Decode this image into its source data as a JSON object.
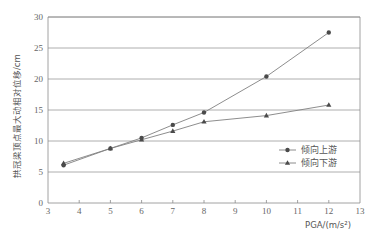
{
  "chart_data": {
    "type": "line",
    "title": "",
    "xlabel": "PGA/(m/s²)",
    "ylabel": "拱冠梁顶点最大动相对位移/cm",
    "xlim": [
      3,
      13
    ],
    "ylim": [
      0,
      30
    ],
    "xticks": [
      3,
      4,
      5,
      6,
      7,
      8,
      9,
      10,
      11,
      12,
      13
    ],
    "yticks": [
      0,
      5,
      10,
      15,
      20,
      25,
      30
    ],
    "grid": "horizontal",
    "legend_position": "lower right inside",
    "x": [
      3.5,
      5,
      6,
      7,
      8,
      10,
      12
    ],
    "series": [
      {
        "name": "倾向上游",
        "marker": "circle",
        "values": [
          6.1,
          8.8,
          10.5,
          12.6,
          14.6,
          20.4,
          27.5
        ]
      },
      {
        "name": "倾向下游",
        "marker": "triangle",
        "values": [
          6.4,
          8.8,
          10.2,
          11.6,
          13.1,
          14.1,
          15.8
        ]
      }
    ]
  },
  "colors": {
    "line": "#808080",
    "marker": "#4a4a4a",
    "grid": "#9a9a9a",
    "axis": "#8a8a8a",
    "text": "#666666"
  }
}
